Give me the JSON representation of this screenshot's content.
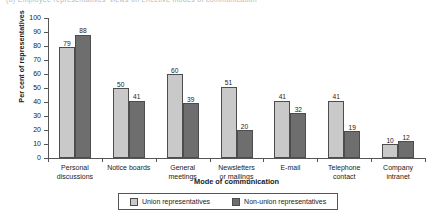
{
  "top_cropped_text": "(b)  Employee representatives' views on effective modes of communication",
  "chart_data": {
    "type": "bar",
    "title": "",
    "xlabel": "Mode of communication",
    "ylabel": "Per cent of representatives",
    "ylim": [
      0,
      100
    ],
    "yticks": [
      0,
      10,
      20,
      30,
      40,
      50,
      60,
      70,
      80,
      90,
      100
    ],
    "grid": false,
    "legend_position": "bottom",
    "categories": [
      "Personal discussions",
      "Notice boards",
      "General meetings",
      "Newsletters or mailings",
      "E-mail",
      "Telephone contact",
      "Company intranet"
    ],
    "category_lines": [
      [
        "Personal",
        "discussions"
      ],
      [
        "Notice boards",
        ""
      ],
      [
        "General",
        "meetings"
      ],
      [
        "Newsletters",
        "or mailings"
      ],
      [
        "E-mail",
        ""
      ],
      [
        "Telephone",
        "contact"
      ],
      [
        "Company",
        "intranet"
      ]
    ],
    "series": [
      {
        "name": "Union representatives",
        "color": "#c9c9c9",
        "values": [
          79,
          50,
          60,
          51,
          41,
          41,
          10
        ]
      },
      {
        "name": "Non-union representatives",
        "color": "#6e6e6e",
        "values": [
          88,
          41,
          39,
          20,
          32,
          19,
          12
        ]
      }
    ]
  }
}
